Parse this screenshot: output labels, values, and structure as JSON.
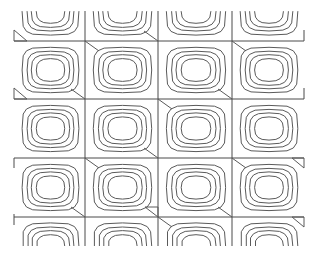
{
  "chart_data": {
    "type": "contour",
    "title": "",
    "xlabel": "",
    "ylabel": "",
    "legend": [],
    "grid": true,
    "grid_columns_x": [
      14,
      85,
      158,
      232,
      304
    ],
    "grid_rows_y": [
      41,
      99,
      158,
      217
    ],
    "full_rows": 3,
    "columns": 4,
    "contour_levels": 4,
    "cell_width": 73,
    "cell_height": 59,
    "contour_scale": [
      0.8,
      0.66,
      0.54,
      0.4
    ],
    "top_partial_row_y": [
      11,
      41
    ],
    "bottom_partial_row_y": [
      217,
      246
    ],
    "stroke_color": "#5a5a5a",
    "background": "#ffffff"
  }
}
